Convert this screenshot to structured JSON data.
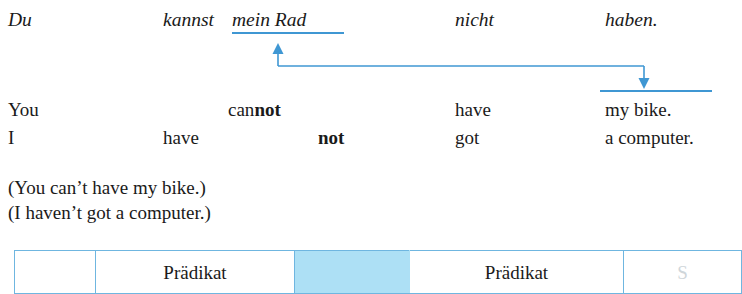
{
  "colors": {
    "arrow_blue": "#3f97d3",
    "underline_blue": "#3f97d3",
    "table_border": "#6fb6e0",
    "highlight_fill": "#ade0f5",
    "text": "#1a1a1a"
  },
  "german_sentence": {
    "label": "german-sentence",
    "words": [
      {
        "text": "Du",
        "x": 8,
        "underlined": false
      },
      {
        "text": "kannst",
        "x": 163,
        "underlined": false
      },
      {
        "text": "mein Rad",
        "x": 232,
        "underlined": true
      },
      {
        "text": "nicht",
        "x": 455,
        "underlined": false
      },
      {
        "text": "haben.",
        "x": 605,
        "underlined": false
      }
    ]
  },
  "english_sentences": [
    {
      "label": "english-sentence-1",
      "words": [
        {
          "text": "You",
          "bold_part": "",
          "x": 8
        },
        {
          "text": "can",
          "bold_part": "not",
          "x": 228
        },
        {
          "text": "have",
          "bold_part": "",
          "x": 455
        },
        {
          "text": "my bike.",
          "bold_part": "",
          "x": 605
        }
      ]
    },
    {
      "label": "english-sentence-2",
      "words": [
        {
          "text": "I",
          "bold_part": "",
          "x": 8
        },
        {
          "text": "have",
          "bold_part": "",
          "x": 163
        },
        {
          "text": "",
          "bold_part": "not",
          "x": 318
        },
        {
          "text": "got",
          "bold_part": "",
          "x": 455
        },
        {
          "text": "a computer.",
          "bold_part": "",
          "x": 605
        }
      ]
    }
  ],
  "paraphrases": [
    {
      "text": "(You can’t have my bike.)"
    },
    {
      "text": "(I haven’t got a computer.)"
    }
  ],
  "table": {
    "label": "analysis-table",
    "columns": [
      {
        "key": "col-1",
        "width": 80,
        "text": "",
        "highlight": false,
        "faded": false
      },
      {
        "key": "col-2",
        "width": 198,
        "text": "Prädikat",
        "highlight": false,
        "faded": false
      },
      {
        "key": "col-3",
        "width": 114,
        "text": "",
        "highlight": true,
        "faded": false
      },
      {
        "key": "col-4",
        "width": 213,
        "text": "Prädikat",
        "highlight": false,
        "faded": false
      },
      {
        "key": "col-5",
        "width": 117,
        "text": "S",
        "highlight": false,
        "faded": true
      }
    ]
  },
  "arrow": {
    "label": "movement-arrow",
    "from_word": "mein Rad",
    "to_word": "my bike.",
    "up_head_x": 278,
    "up_head_y": 47,
    "elbow_y": 66,
    "down_head_x": 644,
    "down_head_y": 86
  }
}
